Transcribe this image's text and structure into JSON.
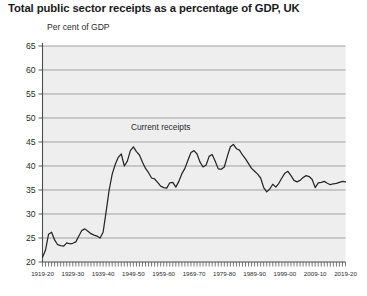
{
  "chart_data": {
    "type": "line",
    "title": "Total public sector receipts as a percentage of GDP, UK",
    "ylabel": "Per cent of GDP",
    "xlabel": "",
    "ylim": [
      20,
      65
    ],
    "ytick_step": 5,
    "ytick_labels": [
      "20",
      "25",
      "30",
      "35",
      "40",
      "45",
      "50",
      "55",
      "60",
      "65"
    ],
    "xtick_labels": [
      "1919-20",
      "1929-30",
      "1939-40",
      "1949-50",
      "1959-60",
      "1969-70",
      "1979-80",
      "1989-90",
      "1999-00",
      "2009-10",
      "2019-20"
    ],
    "grid": true,
    "legend_position": "inline-annotation",
    "series": [
      {
        "name": "Current receipts",
        "color": "#262626",
        "x": [
          "1919-20",
          "1920-21",
          "1921-22",
          "1922-23",
          "1923-24",
          "1924-25",
          "1925-26",
          "1926-27",
          "1927-28",
          "1928-29",
          "1929-30",
          "1930-31",
          "1931-32",
          "1932-33",
          "1933-34",
          "1934-35",
          "1935-36",
          "1936-37",
          "1937-38",
          "1938-39",
          "1939-40",
          "1940-41",
          "1941-42",
          "1942-43",
          "1943-44",
          "1944-45",
          "1945-46",
          "1946-47",
          "1947-48",
          "1948-49",
          "1949-50",
          "1950-51",
          "1951-52",
          "1952-53",
          "1953-54",
          "1954-55",
          "1955-56",
          "1956-57",
          "1957-58",
          "1958-59",
          "1959-60",
          "1960-61",
          "1961-62",
          "1962-63",
          "1963-64",
          "1964-65",
          "1965-66",
          "1966-67",
          "1967-68",
          "1968-69",
          "1969-70",
          "1970-71",
          "1971-72",
          "1972-73",
          "1973-74",
          "1974-75",
          "1975-76",
          "1976-77",
          "1977-78",
          "1978-79",
          "1979-80",
          "1980-81",
          "1981-82",
          "1982-83",
          "1983-84",
          "1984-85",
          "1985-86",
          "1986-87",
          "1987-88",
          "1988-89",
          "1989-90",
          "1990-91",
          "1991-92",
          "1992-93",
          "1993-94",
          "1994-95",
          "1995-96",
          "1996-97",
          "1997-98",
          "1998-99",
          "1999-00",
          "2000-01",
          "2001-02",
          "2002-03",
          "2003-04",
          "2004-05",
          "2005-06",
          "2006-07",
          "2007-08",
          "2008-09",
          "2009-10",
          "2010-11",
          "2011-12",
          "2012-13",
          "2013-14",
          "2014-15",
          "2015-16",
          "2016-17",
          "2017-18",
          "2018-19",
          "2019-20"
        ],
        "values": [
          21.0,
          22.5,
          25.8,
          26.2,
          24.6,
          23.6,
          23.4,
          23.3,
          24.0,
          23.8,
          23.9,
          24.2,
          25.4,
          26.6,
          26.9,
          26.4,
          25.9,
          25.6,
          25.4,
          25.0,
          26.2,
          30.5,
          35.0,
          38.3,
          40.3,
          41.8,
          42.5,
          40.0,
          41.0,
          43.2,
          44.0,
          43.0,
          42.3,
          40.8,
          39.5,
          38.6,
          37.5,
          37.3,
          36.6,
          35.8,
          35.5,
          35.4,
          36.5,
          36.6,
          35.6,
          36.8,
          38.4,
          39.5,
          41.2,
          42.8,
          43.2,
          42.5,
          40.8,
          39.8,
          40.2,
          42.0,
          42.4,
          41.0,
          39.4,
          39.3,
          39.8,
          42.0,
          44.0,
          44.5,
          43.6,
          43.3,
          42.3,
          41.5,
          40.5,
          39.5,
          38.9,
          38.3,
          37.5,
          35.5,
          34.6,
          35.2,
          36.2,
          35.6,
          36.4,
          37.5,
          38.5,
          38.9,
          38.0,
          37.0,
          36.7,
          37.0,
          37.6,
          38.0,
          37.8,
          37.2,
          35.5,
          36.5,
          36.6,
          36.8,
          36.4,
          36.1,
          36.3,
          36.4,
          36.6,
          36.8,
          36.7
        ]
      }
    ],
    "annotations": [
      {
        "text": "Current receipts",
        "x_value": "1958-59",
        "y_value": 47.5
      }
    ]
  },
  "colors": {
    "plot_background": "#eeeeee",
    "gridline": "#8c8c8c",
    "axis": "#4d4d4d",
    "series": "#262626",
    "page_background": "#ffffff",
    "title_text": "#1a1a1a"
  }
}
